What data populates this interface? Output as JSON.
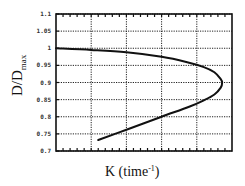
{
  "chart_data": {
    "type": "line",
    "title": "",
    "xlabel": "K (time",
    "xlabel_superscript": "-1",
    "xlabel_close": ")",
    "ylabel": "D/D",
    "ylabel_subscript": "max",
    "ylim": [
      0.7,
      1.1
    ],
    "xlim": [
      0,
      5
    ],
    "grid": true,
    "legend": null,
    "y_ticks": [
      "1.1",
      "1.05",
      "1",
      "0.95",
      "0.9",
      "0.85",
      "0.8",
      "0.75",
      "0.7"
    ],
    "x_ticks": [],
    "series": [
      {
        "name": "K vs D/Dmax",
        "color": "#111111",
        "points": [
          {
            "x": 0.0,
            "y": 1.0
          },
          {
            "x": 1.0,
            "y": 0.995
          },
          {
            "x": 2.0,
            "y": 0.988
          },
          {
            "x": 3.0,
            "y": 0.975
          },
          {
            "x": 3.7,
            "y": 0.96
          },
          {
            "x": 4.2,
            "y": 0.945
          },
          {
            "x": 4.5,
            "y": 0.93
          },
          {
            "x": 4.68,
            "y": 0.91
          },
          {
            "x": 4.72,
            "y": 0.9
          },
          {
            "x": 4.68,
            "y": 0.885
          },
          {
            "x": 4.5,
            "y": 0.865
          },
          {
            "x": 4.2,
            "y": 0.848
          },
          {
            "x": 3.8,
            "y": 0.83
          },
          {
            "x": 3.0,
            "y": 0.8
          },
          {
            "x": 2.0,
            "y": 0.762
          },
          {
            "x": 1.2,
            "y": 0.732
          }
        ]
      }
    ]
  }
}
